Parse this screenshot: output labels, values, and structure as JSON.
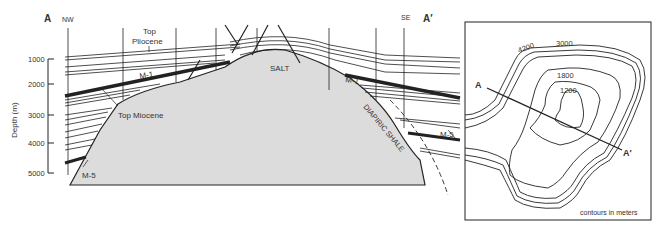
{
  "cross_section": {
    "label_start": "A",
    "label_end": "A′",
    "dir_start": "NW",
    "dir_end": "SE",
    "y_axis_label": "Depth (m)",
    "y_ticks": [
      "1000",
      "2000",
      "3000",
      "4000",
      "5000"
    ],
    "labels": {
      "top_pliocene_1": "Top",
      "top_pliocene_2": "Pliocene",
      "m1_left": "M-1",
      "m1_right": "M-1",
      "salt": "SALT",
      "top_miocene": "Top Miocene",
      "m5_left": "M-5",
      "m5_right": "M-5",
      "diapiric_shale": "DIAPIRIC SHALE"
    },
    "colors": {
      "salt_fill": "#dcdcdc",
      "line": "#222222"
    }
  },
  "contour_map": {
    "contour_labels": [
      "4200",
      "3000",
      "1800",
      "1200"
    ],
    "section_start": "A",
    "section_end": "A′",
    "note": "contours in meters"
  }
}
